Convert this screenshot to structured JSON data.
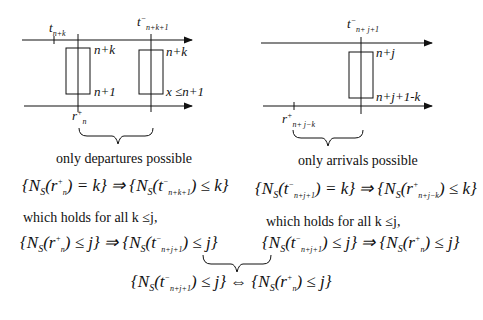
{
  "left_panel": {
    "label_t_nk": "t",
    "label_t_nk_sub": "n+k",
    "label_t_nk1": "t",
    "label_t_nk1_sup": "−",
    "label_t_nk1_sub": "n+k+1",
    "rect1_top": "n+k",
    "rect1_bottom": "n+1",
    "rect2_top": "n+k",
    "rect2_bottom": "x ≤n+1",
    "label_rn": "r",
    "label_rn_sup": "+",
    "label_rn_sub": "n",
    "caption": "only departures possible",
    "implication": "{N_S(r_n^+) = k} ⇒ {N_S(t^-_{n+k+1}) ≤ k}",
    "holds": "which holds for all k ≤j,"
  },
  "right_panel": {
    "label_t": "t",
    "label_t_sup": "−",
    "label_t_sub": "n+ j+1",
    "rect_top": "n+j",
    "rect_bottom": "n+j+1-k",
    "label_r": "r",
    "label_r_sup": "+",
    "label_r_sub": "n+ j−k",
    "caption": "only arrivals possible",
    "implication": "{N_S(t^-_{n+j+1}) = k} ⇒ {N_S(r^+_{n+j-k}) ≤ k}",
    "holds": "which holds for all k ≤j,"
  },
  "bottom": {
    "left_eq": "{N_S(r_n^+) ≤ j} ⇒ {N_S(t^-_{n+j+1}) ≤ j}",
    "right_eq": "{N_S(t^-_{n+j+1}) ≤ j} ⇒ {N_S(r_n^+) ≤ j}",
    "conclusion": "{N_S(t^-_{n+j+1}) ≤ j} ⇔ {N_S(r_n^+) ≤ j}"
  }
}
